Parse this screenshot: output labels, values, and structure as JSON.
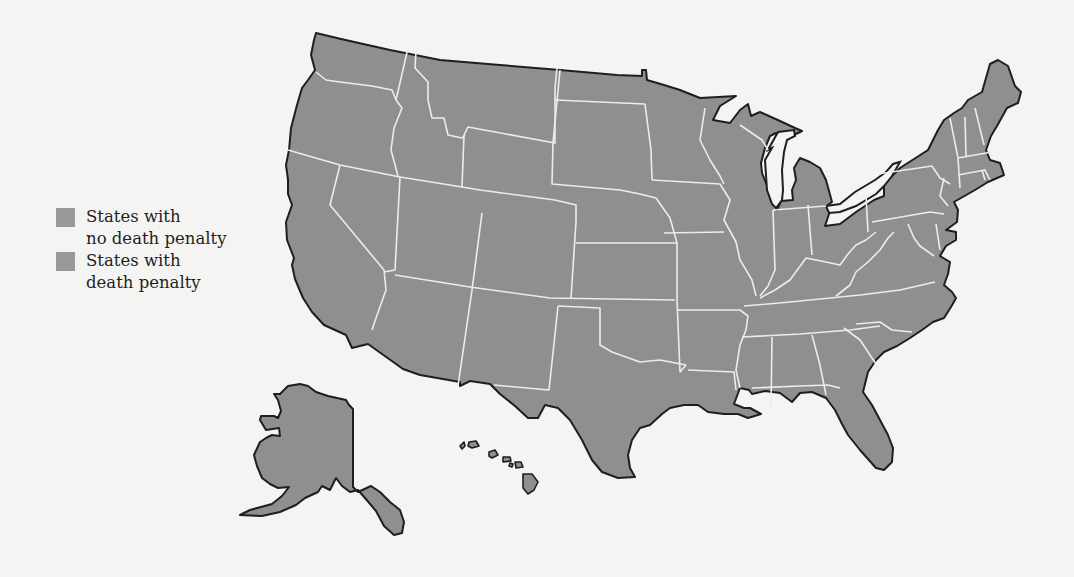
{
  "map": {
    "title": "United States death penalty map",
    "fill_color": "#8f8f8f",
    "border_color": "#1e1e1e",
    "state_line_color": "#ececec",
    "background": "#f4f4f2",
    "regions": [
      "Contiguous United States",
      "Alaska",
      "Hawaii"
    ]
  },
  "legend": {
    "items": [
      {
        "label": "States with\nno death penalty",
        "color": "#999999"
      },
      {
        "label": "States with\ndeath penalty",
        "color": "#999999"
      }
    ]
  }
}
